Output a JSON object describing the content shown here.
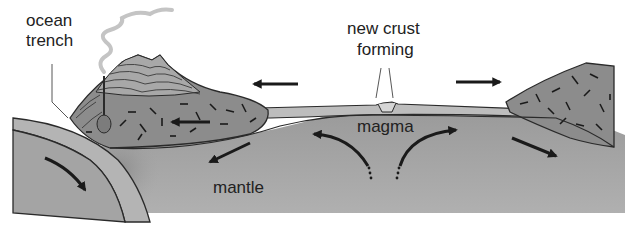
{
  "labels": {
    "ocean_trench_line1": "ocean",
    "ocean_trench_line2": "trench",
    "new_crust_line1": "new crust",
    "new_crust_line2": "forming",
    "magma": "magma",
    "mantle": "mantle"
  },
  "colors": {
    "background": "#ffffff",
    "mantle": "#a9a9a9",
    "mantle_dark": "#8f8f8f",
    "oceanic_crust": "#b8b8b8",
    "continental_crust": "#8a8a8a",
    "volcano_layers": "#9e9e9e",
    "outline": "#2a2a2a",
    "arrow": "#1a1a1a",
    "smoke": "#c8c8c8"
  },
  "arrows": [
    {
      "name": "plate-left-arrow",
      "direction": "left"
    },
    {
      "name": "plate-right-arrow",
      "direction": "right"
    },
    {
      "name": "continent-left-arrow",
      "direction": "left"
    },
    {
      "name": "mantle-left-arrow",
      "direction": "down-left"
    },
    {
      "name": "mantle-right-arrow",
      "direction": "down-right"
    },
    {
      "name": "subduction-arrow",
      "direction": "down-right"
    },
    {
      "name": "convection-left-arrow",
      "direction": "up-left"
    },
    {
      "name": "convection-right-arrow",
      "direction": "up-right"
    }
  ]
}
